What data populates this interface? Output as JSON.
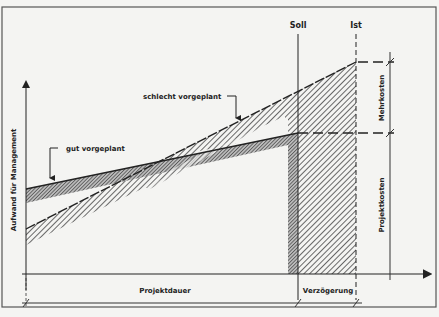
{
  "diagram": {
    "type": "project-cost-time diagram",
    "y_axis_label": "Aufwand für Management",
    "x_axis_label": "Projektdauer",
    "markers": {
      "soll": "Soll",
      "ist": "Ist"
    },
    "series": [
      {
        "name": "gut vorgeplant",
        "label": "gut vorgeplant",
        "fill": "dense-hatch"
      },
      {
        "name": "schlecht vorgeplant",
        "label": "schlecht vorgeplant",
        "fill": "diagonal-hatch"
      }
    ],
    "right_dimensions": {
      "upper": "Mehrkosten",
      "lower": "Projektkosten"
    },
    "bottom_dimensions": {
      "left": "Projektdauer",
      "right": "Verzögerung"
    },
    "colors": {
      "background": "#f4f4f2",
      "ink": "#222222",
      "hatch": "#555555",
      "frame": "#555555"
    }
  }
}
